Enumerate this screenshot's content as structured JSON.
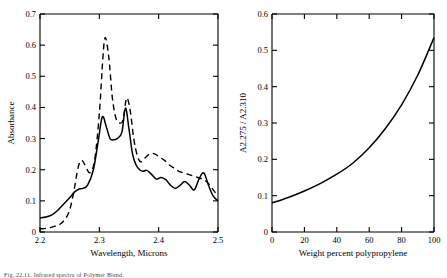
{
  "figure": {
    "caption": "Fig. 22.11.  Infrared spectra of Polymer Blend."
  },
  "chart_data": [
    {
      "id": "left",
      "type": "line",
      "title": "",
      "xlabel": "Wavelength, Microns",
      "ylabel": "Absorbance",
      "xlim": [
        2.2,
        2.5
      ],
      "ylim": [
        0.0,
        0.7
      ],
      "xticks": [
        "2.2",
        "2.3",
        "2.4",
        "2.5"
      ],
      "yticks": [
        "0",
        "0.1",
        "0.2",
        "0.3",
        "0.4",
        "0.5",
        "0.6",
        "0.7"
      ],
      "grid": false,
      "legend": "none",
      "series": [
        {
          "name": "solid-curve",
          "style": "solid",
          "x": [
            2.2,
            2.21,
            2.22,
            2.23,
            2.24,
            2.25,
            2.258,
            2.266,
            2.272,
            2.28,
            2.29,
            2.298,
            2.305,
            2.312,
            2.318,
            2.324,
            2.33,
            2.338,
            2.344,
            2.35,
            2.356,
            2.362,
            2.368,
            2.374,
            2.38,
            2.388,
            2.396,
            2.404,
            2.412,
            2.42,
            2.428,
            2.436,
            2.444,
            2.452,
            2.46,
            2.468,
            2.476,
            2.484,
            2.492,
            2.5
          ],
          "y": [
            0.045,
            0.048,
            0.055,
            0.07,
            0.09,
            0.11,
            0.128,
            0.138,
            0.14,
            0.15,
            0.2,
            0.29,
            0.37,
            0.336,
            0.3,
            0.296,
            0.3,
            0.32,
            0.398,
            0.33,
            0.25,
            0.215,
            0.2,
            0.195,
            0.198,
            0.185,
            0.17,
            0.175,
            0.168,
            0.15,
            0.14,
            0.15,
            0.162,
            0.15,
            0.135,
            0.17,
            0.19,
            0.15,
            0.115,
            0.1
          ]
        },
        {
          "name": "dashed-curve",
          "style": "dashed",
          "x": [
            2.2,
            2.212,
            2.224,
            2.236,
            2.248,
            2.256,
            2.264,
            2.27,
            2.276,
            2.284,
            2.292,
            2.3,
            2.306,
            2.31,
            2.316,
            2.322,
            2.328,
            2.334,
            2.34,
            2.346,
            2.352,
            2.358,
            2.364,
            2.37,
            2.378,
            2.386,
            2.394,
            2.402,
            2.41,
            2.418,
            2.426,
            2.434,
            2.442,
            2.45,
            2.458,
            2.466,
            2.474,
            2.482,
            2.49,
            2.5
          ],
          "y": [
            0.01,
            0.012,
            0.018,
            0.028,
            0.06,
            0.12,
            0.205,
            0.23,
            0.215,
            0.19,
            0.23,
            0.38,
            0.56,
            0.625,
            0.56,
            0.43,
            0.365,
            0.35,
            0.36,
            0.43,
            0.39,
            0.3,
            0.245,
            0.225,
            0.24,
            0.252,
            0.25,
            0.24,
            0.23,
            0.215,
            0.205,
            0.195,
            0.19,
            0.185,
            0.18,
            0.175,
            0.17,
            0.16,
            0.14,
            0.115
          ]
        }
      ]
    },
    {
      "id": "right",
      "type": "line",
      "title": "",
      "xlabel": "Weight percent polypropylene",
      "ylabel": "A2.275 / A2.310",
      "xlim": [
        0,
        100
      ],
      "ylim": [
        0.0,
        0.6
      ],
      "xticks": [
        "0",
        "20",
        "40",
        "60",
        "80",
        "100"
      ],
      "yticks": [
        "0",
        "0.1",
        "0.2",
        "0.3",
        "0.4",
        "0.5",
        "0.6"
      ],
      "grid": false,
      "legend": "none",
      "series": [
        {
          "name": "calibration-curve",
          "style": "solid",
          "x": [
            0,
            10,
            20,
            30,
            40,
            50,
            60,
            70,
            80,
            90,
            100
          ],
          "y": [
            0.08,
            0.095,
            0.113,
            0.134,
            0.159,
            0.19,
            0.232,
            0.285,
            0.35,
            0.432,
            0.535
          ]
        }
      ]
    }
  ]
}
